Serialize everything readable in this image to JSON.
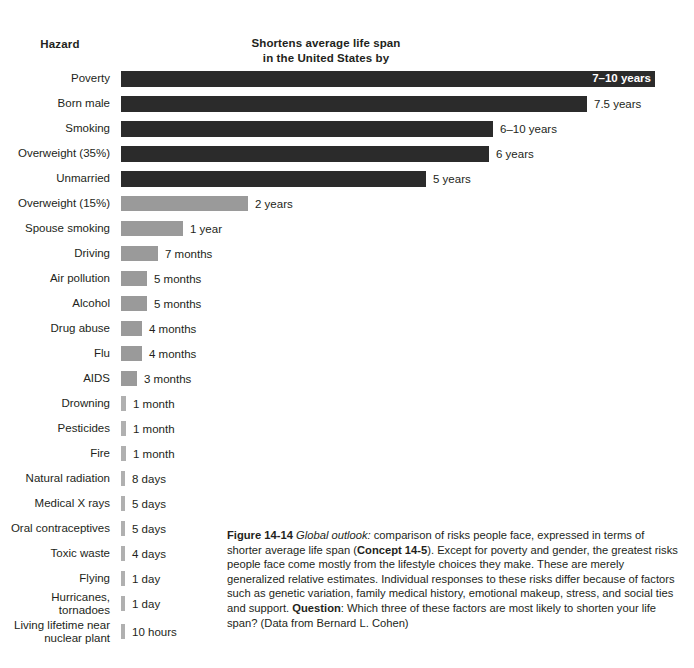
{
  "header": {
    "hazard_label": "Hazard",
    "value_label_line1": "Shortens average life span",
    "value_label_line2": "in the United States by"
  },
  "colors": {
    "bar_dark": "#2b2b2b",
    "bar_gray": "#9a9a9a",
    "bar_sliver": "#b0b0b0",
    "text": "#231f20",
    "background": "#ffffff",
    "inside_label": "#ffffff"
  },
  "caption": {
    "figure_number": "Figure 14-14",
    "lead_italic": "Global outlook:",
    "text_1": " comparison of risks people face, expressed in terms of shorter average life span (",
    "concept": "Concept 14-5",
    "text_2": "). Except for poverty and gender, the greatest risks people face come mostly from the lifestyle choices they make. These are merely generalized relative estimates. Individual responses to these risks differ because of factors such as genetic variation, family medical history, emotional makeup, stress, and social ties and support. ",
    "question_label": "Question",
    "text_3": ": Which three of these factors are most likely to shorten your life span? (Data from Bernard L. Cohen)"
  },
  "chart_data": {
    "type": "bar",
    "orientation": "horizontal",
    "title": "Shortens average life span in the United States by",
    "xlabel": "Shortens average life span in the United States by",
    "ylabel": "Hazard",
    "grid": false,
    "legend": "none",
    "categories": [
      "Poverty",
      "Born male",
      "Smoking",
      "Overweight (35%)",
      "Unmarried",
      "Overweight (15%)",
      "Spouse smoking",
      "Driving",
      "Air pollution",
      "Alcohol",
      "Drug abuse",
      "Flu",
      "AIDS",
      "Drowning",
      "Pesticides",
      "Fire",
      "Natural radiation",
      "Medical X rays",
      "Oral contraceptives",
      "Toxic waste",
      "Flying",
      "Hurricanes, tornadoes",
      "Living lifetime near\nnuclear plant"
    ],
    "value_labels": [
      "7–10 years",
      "7.5 years",
      "6–10 years",
      "6 years",
      "5 years",
      "2 years",
      "1 year",
      "7 months",
      "5 months",
      "5 months",
      "4 months",
      "4 months",
      "3 months",
      "1 month",
      "1 month",
      "1 month",
      "8 days",
      "5 days",
      "5 days",
      "4 days",
      "1 day",
      "1 day",
      "10 hours"
    ],
    "values_days": [
      3102,
      2738,
      2920,
      2190,
      1825,
      730,
      365,
      213,
      152,
      152,
      122,
      122,
      91,
      30,
      30,
      30,
      8,
      5,
      5,
      4,
      1,
      1,
      0.42
    ],
    "bar_pixel_widths": [
      534,
      466,
      372,
      368,
      305,
      127,
      62,
      37,
      26,
      26,
      21,
      21,
      16,
      5,
      5,
      5,
      4,
      4,
      4,
      4,
      4,
      4,
      4
    ],
    "bar_shades": [
      "dark",
      "dark",
      "dark",
      "dark",
      "dark",
      "gray",
      "gray",
      "gray",
      "gray",
      "gray",
      "gray",
      "gray",
      "gray",
      "sliver",
      "sliver",
      "sliver",
      "sliver",
      "sliver",
      "sliver",
      "sliver",
      "sliver",
      "sliver",
      "sliver"
    ],
    "label_inside": [
      true,
      false,
      false,
      false,
      false,
      false,
      false,
      false,
      false,
      false,
      false,
      false,
      false,
      false,
      false,
      false,
      false,
      false,
      false,
      false,
      false,
      false,
      false
    ]
  }
}
